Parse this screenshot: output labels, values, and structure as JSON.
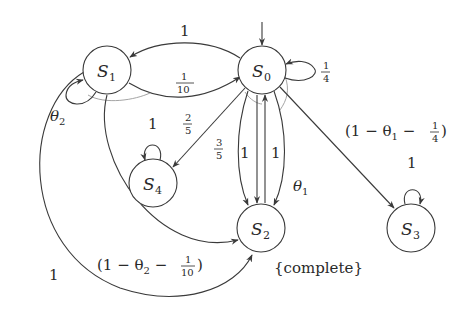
{
  "diagram": {
    "type": "state-transition (Markov chain)",
    "nodes": [
      {
        "id": "S0",
        "label": "S",
        "sub": "0",
        "initial": true
      },
      {
        "id": "S1",
        "label": "S",
        "sub": "1"
      },
      {
        "id": "S2",
        "label": "S",
        "sub": "2",
        "annotation": "{complete}"
      },
      {
        "id": "S3",
        "label": "S",
        "sub": "3"
      },
      {
        "id": "S4",
        "label": "S",
        "sub": "4"
      }
    ],
    "edges": [
      {
        "from": "S0",
        "to": "S1",
        "label": "1"
      },
      {
        "from": "S1",
        "to": "S0",
        "label": "1/10"
      },
      {
        "from": "S0",
        "to": "S0",
        "label": "1/4"
      },
      {
        "from": "S1",
        "to": "S1",
        "label": "θ2"
      },
      {
        "from": "S0",
        "to": "S4",
        "label": "2/5"
      },
      {
        "from": "S4",
        "to": "S4",
        "label": "1"
      },
      {
        "from": "S0",
        "to": "S2",
        "label": "3/5"
      },
      {
        "from": "S0",
        "to": "S2",
        "label": "1"
      },
      {
        "from": "S2",
        "to": "S0",
        "label": "1"
      },
      {
        "from": "S0",
        "to": "S2",
        "label": "θ1"
      },
      {
        "from": "S0",
        "to": "S3",
        "label": "(1 − θ1 − 1/4)"
      },
      {
        "from": "S3",
        "to": "S3",
        "label": "1"
      },
      {
        "from": "S1",
        "to": "S2",
        "label": "(1 − θ2 − 1/10)"
      },
      {
        "from": "S1",
        "to": "S2",
        "label": "1"
      }
    ],
    "labels": {
      "e_s0_s1": "1",
      "e_s1_s0_num": "1",
      "e_s1_s0_den": "10",
      "e_s0_loop_num": "1",
      "e_s0_loop_den": "4",
      "e_s1_loop": "θ",
      "e_s1_loop_sub": "2",
      "e_s0_s4_num": "2",
      "e_s0_s4_den": "5",
      "e_s4_loop": "1",
      "e_s0_s2a_num": "3",
      "e_s0_s2a_den": "5",
      "e_s0_s2b": "1",
      "e_s2_s0": "1",
      "e_s0_s2c": "θ",
      "e_s0_s2c_sub": "1",
      "e_s0_s3_pre": "(1 − θ",
      "e_s0_s3_sub": "1",
      "e_s0_s3_mid": " − ",
      "e_s0_s3_num": "1",
      "e_s0_s3_den": "4",
      "e_s0_s3_post": ")",
      "e_s3_loop": "1",
      "e_s1_s2a_pre": "(1 − θ",
      "e_s1_s2a_sub": "2",
      "e_s1_s2a_mid": " − ",
      "e_s1_s2a_num": "1",
      "e_s1_s2a_den": "10",
      "e_s1_s2a_post": ")",
      "e_s1_s2b": "1",
      "s2_annotation": "{complete}"
    }
  }
}
